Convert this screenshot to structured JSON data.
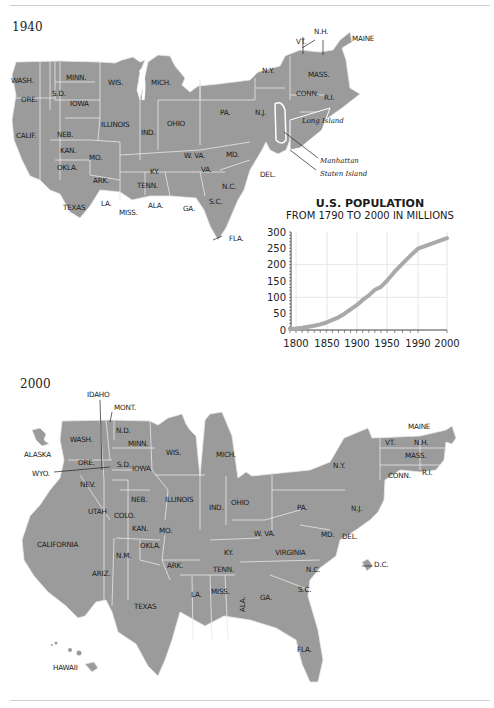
{
  "maps": [
    {
      "year_label": "1940",
      "labels": [
        "WASH.",
        "ORE.",
        "CALIF.",
        "S.D.",
        "MINN.",
        "IOWA",
        "WIS.",
        "MICH.",
        "NEB.",
        "KAN.",
        "OKLA.",
        "TEXAS",
        "MO.",
        "ARK.",
        "LA.",
        "MISS.",
        "ALA.",
        "ILLINOIS",
        "IND.",
        "OHIO",
        "KY.",
        "TENN.",
        "W. VA.",
        "VA.",
        "MD.",
        "DEL.",
        "N.C.",
        "S.C.",
        "GA.",
        "FLA.",
        "PA.",
        "N.Y.",
        "N.J.",
        "VT.",
        "N.H.",
        "MAINE",
        "MASS.",
        "CONN.",
        "R.I."
      ],
      "callouts": {
        "long_island": "Long Island",
        "manhattan": "Manhattan",
        "staten_island": "Staten Island"
      }
    },
    {
      "year_label": "2000",
      "labels": [
        "IDAHO",
        "MONT.",
        "N.D.",
        "WASH.",
        "MINN.",
        "ALASKA",
        "ORE.",
        "S.D.",
        "IOWA",
        "WYO.",
        "WIS.",
        "MICH.",
        "NEV.",
        "NEB.",
        "ILLINOIS",
        "UTAH",
        "COLO.",
        "KAN.",
        "MO.",
        "IND.",
        "OHIO",
        "CALIFORNIA",
        "N.M.",
        "OKLA.",
        "ARIZ.",
        "ARK.",
        "TEXAS",
        "LA.",
        "MISS.",
        "ALA.",
        "GA.",
        "S.C.",
        "N.C.",
        "TENN.",
        "KY.",
        "VIRGINIA",
        "W. VA.",
        "MD.",
        "DEL.",
        "N.J.",
        "PA.",
        "N.Y.",
        "VT.",
        "N.H.",
        "MAINE",
        "MASS.",
        "CONN.",
        "R.I.",
        "D.C.",
        "FLA.",
        "HAWAII"
      ]
    }
  ],
  "chart_data": {
    "type": "line",
    "title": "U.S. POPULATION",
    "subtitle": "FROM 1790 TO 2000 IN MILLIONS",
    "xlabel": "",
    "ylabel": "",
    "x_tick_labels": [
      "1800",
      "1850",
      "1900",
      "1950",
      "1990",
      "2000"
    ],
    "y_tick_labels": [
      "0",
      "50",
      "100",
      "150",
      "200",
      "250",
      "300"
    ],
    "ylim": [
      0,
      300
    ],
    "grid": true,
    "legend": null,
    "series": [
      {
        "name": "U.S. Population (millions)",
        "x": [
          1790,
          1800,
          1810,
          1820,
          1830,
          1840,
          1850,
          1860,
          1870,
          1880,
          1890,
          1900,
          1910,
          1920,
          1930,
          1940,
          1950,
          1960,
          1970,
          1980,
          1990,
          2000
        ],
        "values": [
          4,
          5,
          7,
          10,
          13,
          17,
          23,
          31,
          39,
          50,
          63,
          76,
          92,
          106,
          123,
          132,
          151,
          179,
          203,
          227,
          249,
          281
        ]
      }
    ],
    "color": "#a9a9a9"
  }
}
